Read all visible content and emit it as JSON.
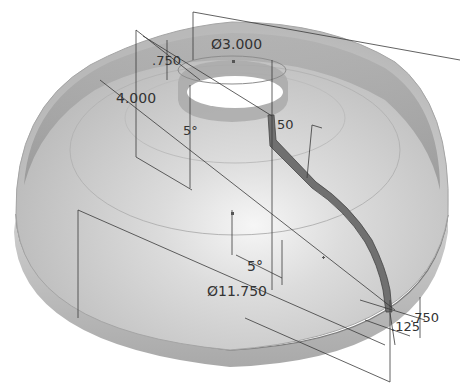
{
  "figure": {
    "colors": {
      "background": "#ffffff",
      "shell_fill": "#c9c9c9",
      "shell_light": "#ececec",
      "band_dark": "#9c9c9c",
      "rib": "#6a6a6a",
      "dimension_line": "#3a3a3a",
      "hole": "#ffffff"
    }
  },
  "dimensions": {
    "top_diameter": "Ø3.000",
    "lip_height": ".750",
    "dome_height": "4.000",
    "upper_angle": "5°",
    "rib_top": "50",
    "lower_angle": "5°",
    "base_diameter": "Ø11.750",
    "rim_height": ".750",
    "rim_offset": ".125"
  }
}
